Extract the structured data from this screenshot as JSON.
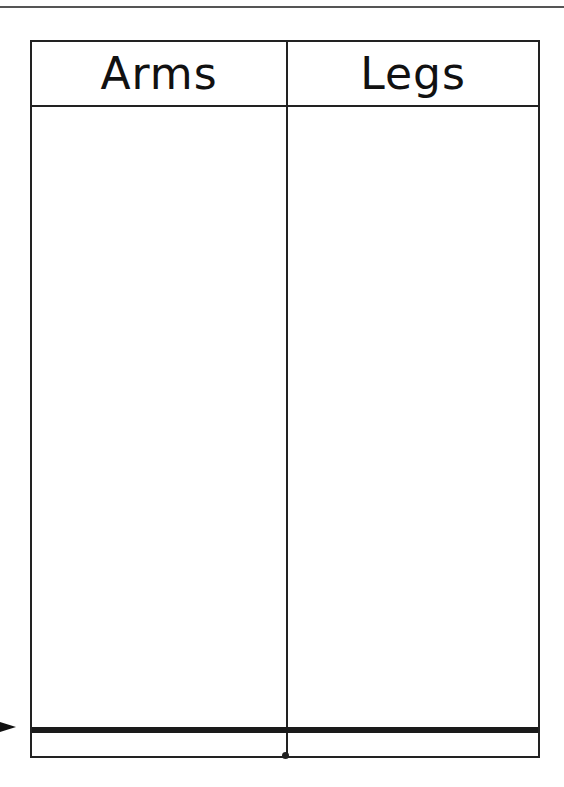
{
  "worksheet": {
    "type": "t-chart",
    "columns": [
      {
        "label": "Arms"
      },
      {
        "label": "Legs"
      }
    ],
    "colors": {
      "line": "#222222",
      "background": "#ffffff"
    },
    "pointer": "arrow-right"
  }
}
